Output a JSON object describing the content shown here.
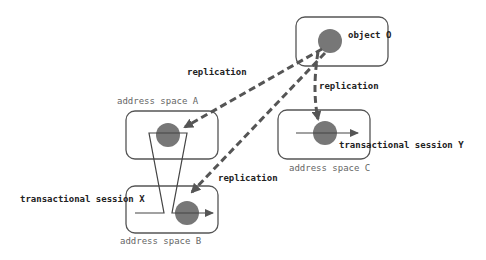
{
  "diagram": {
    "nodes": {
      "object_o": {
        "label": "object O"
      },
      "address_space_a": {
        "label": "address space A"
      },
      "address_space_b": {
        "label": "address space B"
      },
      "address_space_c": {
        "label": "address space C"
      }
    },
    "edges": {
      "replication_to_a": {
        "label": "replication"
      },
      "replication_to_c": {
        "label": "replication"
      },
      "replication_to_b": {
        "label": "replication"
      }
    },
    "sessions": {
      "x": {
        "label": "transactional session X"
      },
      "y": {
        "label": "transactional session Y"
      }
    },
    "colors": {
      "box_stroke": "#555555",
      "object_fill": "#777777",
      "arrow": "#555555",
      "text": "#333333"
    }
  }
}
